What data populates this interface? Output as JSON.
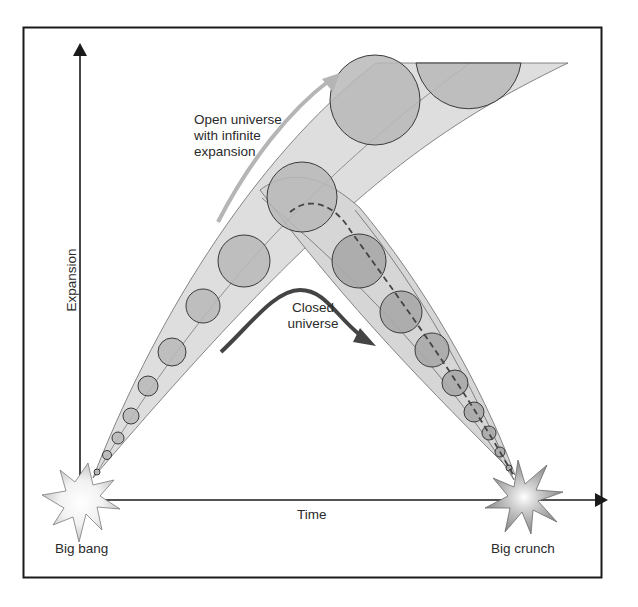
{
  "diagram": {
    "title": "",
    "axes": {
      "y_label": "Expansion",
      "x_label": "Time"
    },
    "labels": {
      "open_universe": [
        "Open universe",
        "with infinite",
        "expansion"
      ],
      "closed_universe": [
        "Closed",
        "universe"
      ],
      "big_bang": "Big bang",
      "big_crunch": "Big crunch"
    },
    "colors": {
      "frame": "#1a1a1a",
      "band_fill": "#dcdcdc",
      "circle_fill": "#b9b9b9",
      "closed_circle_fill": "#a9a9a9",
      "open_arrow": "#b5b5b5",
      "closed_arrow": "#444444",
      "dashed_path": "#444444"
    }
  }
}
